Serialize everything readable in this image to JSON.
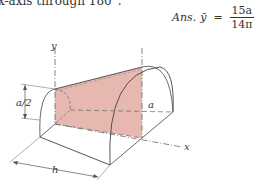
{
  "problem_text": "x-axis through 180°.",
  "answer": {
    "prefix": "Ans.",
    "symbol": "ȳ",
    "equals": "=",
    "numerator": "15a",
    "denominator": "14π"
  },
  "figure": {
    "labels": {
      "y_axis": "y",
      "x_axis": "x",
      "half_a": "a/2",
      "a": "a",
      "h": "h"
    },
    "shaded_color": "#e6b8b0",
    "line_color": "#555555"
  }
}
